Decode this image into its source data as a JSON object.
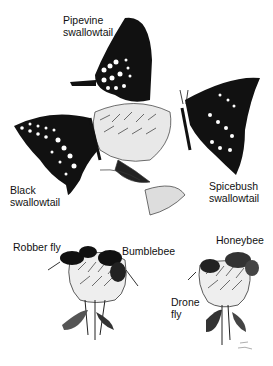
{
  "illustration": {
    "subject": "Mimicry among insects",
    "groups": [
      {
        "name": "butterflies",
        "labels": [
          {
            "id": "pipevine",
            "text": "Pipevine\nswallowtail"
          },
          {
            "id": "black",
            "text": "Black\nswallowtail"
          },
          {
            "id": "spicebush",
            "text": "Spicebush\nswallowtail"
          }
        ]
      },
      {
        "name": "bees-and-flies",
        "labels": [
          {
            "id": "robber",
            "text": "Robber fly"
          },
          {
            "id": "bumble",
            "text": "Bumblebee"
          },
          {
            "id": "honey",
            "text": "Honeybee"
          },
          {
            "id": "drone",
            "text": "Drone\nfly"
          }
        ]
      }
    ],
    "colors": {
      "ink": "#111111",
      "paper": "#ffffff",
      "shade": "#888888"
    }
  }
}
